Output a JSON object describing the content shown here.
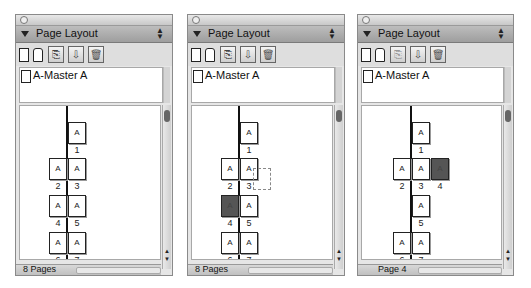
{
  "panels": [
    {
      "id": "panel-1",
      "title": "Page Layout",
      "master": "A-Master A",
      "status": "8 Pages",
      "toolbar": [
        "new-page-icon",
        "new-master-icon",
        "duplicate-icon",
        "insert-icon",
        "trash-icon"
      ],
      "pages": [
        {
          "num": "1",
          "label": "A"
        },
        {
          "num": "2",
          "label": "A"
        },
        {
          "num": "3",
          "label": "A"
        },
        {
          "num": "4",
          "label": "A"
        },
        {
          "num": "5",
          "label": "A"
        },
        {
          "num": "6",
          "label": "A"
        },
        {
          "num": "7",
          "label": "A"
        }
      ]
    },
    {
      "id": "panel-2",
      "title": "Page Layout",
      "master": "A-Master A",
      "status": "8 Pages",
      "toolbar": [
        "new-page-icon",
        "new-master-icon",
        "duplicate-icon",
        "insert-icon",
        "trash-icon"
      ],
      "pages": [
        {
          "num": "1",
          "label": "A"
        },
        {
          "num": "2",
          "label": "A"
        },
        {
          "num": "3",
          "label": "A"
        },
        {
          "num": "4",
          "label": "A",
          "selected": true
        },
        {
          "num": "5",
          "label": "A"
        },
        {
          "num": "6",
          "label": "A"
        },
        {
          "num": "7",
          "label": "A"
        }
      ]
    },
    {
      "id": "panel-3",
      "title": "Page Layout",
      "master": "A-Master A",
      "status": "Page 4",
      "toolbar": [
        "new-page-icon",
        "new-master-icon",
        "duplicate-icon",
        "insert-icon",
        "trash-icon"
      ],
      "pages": [
        {
          "num": "1",
          "label": "A"
        },
        {
          "num": "2",
          "label": "A"
        },
        {
          "num": "3",
          "label": "A"
        },
        {
          "num": "4",
          "label": "A",
          "selected": true
        },
        {
          "num": "5",
          "label": "A"
        },
        {
          "num": "6",
          "label": "A"
        },
        {
          "num": "7",
          "label": "A"
        }
      ]
    }
  ],
  "colors": {
    "selected_page": "#555555",
    "panel_bg": "#e6e6e6",
    "header_bg": "#a8a8a8"
  }
}
